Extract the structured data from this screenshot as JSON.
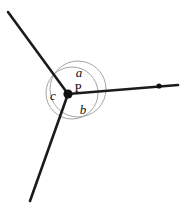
{
  "figure": {
    "colors": {
      "ray": "#1b1b1b",
      "arc": "#9a9a9a",
      "vertex": "#111111",
      "background": "#ffffff",
      "label": "#111111"
    },
    "vertex": {
      "name": "P",
      "label": "P",
      "x": 68,
      "y": 94,
      "dot_radius": 4.6,
      "label_x": 78,
      "label_y": 92
    },
    "rays": [
      {
        "id": "ray-upper-left",
        "from_x": 68,
        "from_y": 94,
        "to_x": 8,
        "to_y": 12,
        "has_end_dot": false
      },
      {
        "id": "ray-right",
        "from_x": 68,
        "from_y": 94,
        "to_x": 178,
        "to_y": 85,
        "has_end_dot": true,
        "end_dot_x": 159,
        "end_dot_y": 86,
        "end_dot_radius": 2.6
      },
      {
        "id": "ray-lower-left",
        "from_x": 68,
        "from_y": 94,
        "to_x": 30,
        "to_y": 201,
        "has_end_dot": false
      }
    ],
    "arcs": [
      {
        "id": "outer-arc-circle",
        "cx": 78,
        "cy": 89,
        "r": 28
      },
      {
        "id": "inner-arc-circle",
        "cx": 72,
        "cy": 93,
        "r": 26
      }
    ],
    "angle_labels": [
      {
        "id": "angle-a",
        "text": "a",
        "x": 79,
        "y": 77,
        "style": "italic"
      },
      {
        "id": "angle-b",
        "text": "b",
        "x": 83,
        "y": 114,
        "style": "italic"
      },
      {
        "id": "angle-c",
        "text": "c",
        "x": 53,
        "y": 100,
        "style": "italic"
      }
    ]
  }
}
